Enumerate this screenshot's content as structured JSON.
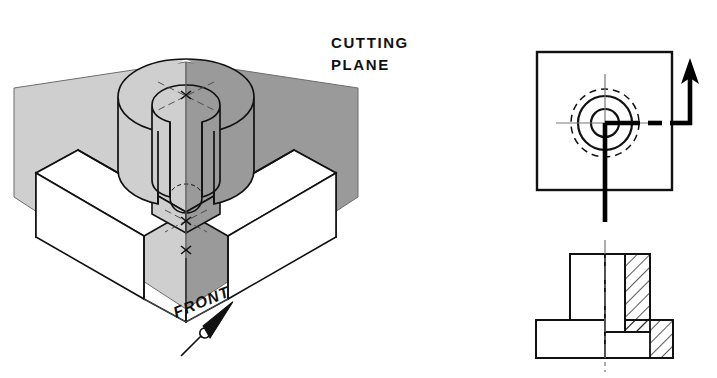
{
  "figure": {
    "width": 717,
    "height": 378,
    "background": "#ffffff"
  },
  "labels": {
    "cutting_line1": "CUTTING",
    "cutting_line2": "PLANE",
    "front": "FRONT"
  },
  "colors": {
    "background": "#ffffff",
    "outline": "#111111",
    "plane_left_fill": "#cfcfcf",
    "plane_right_fill": "#9a9a9a",
    "plane_edge": "#6d6d6d",
    "hatch": "#111111",
    "centerline": "#555555",
    "cutting_plane_line": "#000000"
  },
  "isometric_view": {
    "name": "pictorial-cut-object",
    "description": "Isometric block with cylindrical boss cut by two vertical cutting planes",
    "planes": [
      {
        "name": "left-cutting-plane",
        "shade": "#cfcfcf"
      },
      {
        "name": "right-cutting-plane",
        "shade": "#9a9a9a"
      }
    ],
    "features": [
      "rectangular base",
      "slot in base",
      "cylindrical boss",
      "through hole",
      "center marks"
    ],
    "direction_arrow": "FRONT"
  },
  "top_view": {
    "name": "top-view",
    "square": {
      "x": 537,
      "y": 52,
      "width": 135,
      "height": 138
    },
    "center": {
      "cx": 605,
      "cy": 123
    },
    "circles": [
      {
        "name": "hole-circle",
        "r": 14,
        "style": "solid"
      },
      {
        "name": "boss-circle",
        "r": 27,
        "style": "solid"
      },
      {
        "name": "hidden-circle",
        "r": 34,
        "style": "dashed"
      }
    ],
    "centerlines": [
      "horizontal",
      "vertical"
    ],
    "cutting_plane_line": {
      "style": "heavy phantom line",
      "arrow_direction": "up",
      "arrow_label": ""
    }
  },
  "front_view": {
    "name": "front-half-section-view",
    "description": "Half section: left half in outline, right half sectioned with 45 degree hatching",
    "hatch_angle_deg": 45,
    "center_line": "vertical",
    "parts": [
      "base flange",
      "vertical boss",
      "counterbored hole"
    ]
  }
}
